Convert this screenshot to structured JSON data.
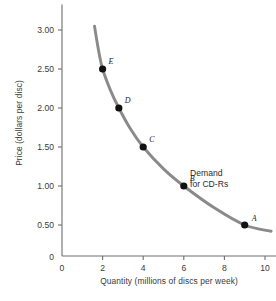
{
  "chart_data": {
    "type": "line",
    "title": "",
    "xlabel": "Quantity (millions of discs per week)",
    "ylabel": "Price (dollars per disc)",
    "xlim": [
      0,
      11
    ],
    "ylim": [
      0,
      3.3
    ],
    "xticks": [
      0,
      2,
      4,
      6,
      8,
      10
    ],
    "xtick_labels": [
      "0",
      "2",
      "4",
      "6",
      "8",
      "10"
    ],
    "yticks": [
      0,
      0.5,
      1.0,
      1.5,
      2.0,
      2.5,
      3.0
    ],
    "ytick_labels": [
      "0",
      "0.50",
      "1.00",
      "1.50",
      "2.00",
      "2.50",
      "3.00"
    ],
    "grid": false,
    "legend_position": "inline-annotation",
    "series": [
      {
        "name": "Demand for CD-Rs",
        "color": "#8a8a8a",
        "x": [
          1.6,
          1.8,
          2.0,
          2.4,
          2.8,
          3.4,
          4.0,
          5.0,
          6.0,
          7.5,
          9.0,
          10.3
        ],
        "y": [
          3.05,
          2.74,
          2.5,
          2.22,
          2.0,
          1.72,
          1.5,
          1.22,
          1.0,
          0.72,
          0.5,
          0.42
        ]
      }
    ],
    "points": [
      {
        "label": "A",
        "x": 9.0,
        "y": 0.5,
        "label_dx": 7,
        "label_dy": -11
      },
      {
        "label": "B",
        "x": 6.0,
        "y": 1.0,
        "label_dx": 6,
        "label_dy": -12
      },
      {
        "label": "C",
        "x": 4.0,
        "y": 1.5,
        "label_dx": 6,
        "label_dy": -12
      },
      {
        "label": "D",
        "x": 2.8,
        "y": 2.0,
        "label_dx": 6,
        "label_dy": -12
      },
      {
        "label": "E",
        "x": 2.0,
        "y": 2.5,
        "label_dx": 6,
        "label_dy": -12
      }
    ],
    "annotations": [
      {
        "name": "demand-curve-label",
        "lines": [
          "Demand",
          "for CD-Rs"
        ],
        "x": 7.3,
        "y": 1.12
      }
    ],
    "colors": {
      "curve": "#8a8a8a",
      "axis": "#6e6e6e",
      "marker": "#111111",
      "text": "#3a3a3a"
    }
  }
}
